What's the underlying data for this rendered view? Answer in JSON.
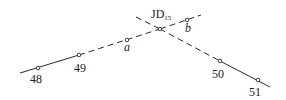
{
  "diagram": {
    "type": "route-intersection",
    "colors": {
      "line": "#2a2a2a",
      "background": "#ffffff"
    },
    "intersection": {
      "label": "JD",
      "subscript": "15",
      "x": 160,
      "y": 29
    },
    "points": [
      {
        "id": "48",
        "label": "48",
        "x": 38,
        "y": 68,
        "lx": 30,
        "ly": 83,
        "style": "num"
      },
      {
        "id": "49",
        "label": "49",
        "x": 79,
        "y": 55,
        "lx": 74,
        "ly": 72,
        "style": "num"
      },
      {
        "id": "a",
        "label": "a",
        "x": 127,
        "y": 40,
        "lx": 124,
        "ly": 51,
        "style": "ital"
      },
      {
        "id": "b",
        "label": "b",
        "x": 187,
        "y": 20,
        "lx": 185,
        "ly": 32,
        "style": "ital"
      },
      {
        "id": "50",
        "label": "50",
        "x": 220,
        "y": 61,
        "lx": 212,
        "ly": 78,
        "style": "num"
      },
      {
        "id": "51",
        "label": "51",
        "x": 258,
        "y": 80,
        "lx": 249,
        "ly": 96,
        "style": "num"
      }
    ],
    "segments": [
      {
        "name": "line-48-49-solid",
        "x1": 20,
        "y1": 73,
        "x2": 79,
        "y2": 55,
        "dashed": false
      },
      {
        "name": "line-49-jd-dashed",
        "x1": 79,
        "y1": 55,
        "x2": 160,
        "y2": 29,
        "dashed": true
      },
      {
        "name": "line-jd-b-dashed",
        "x1": 160,
        "y1": 29,
        "x2": 201,
        "y2": 15,
        "dashed": true
      },
      {
        "name": "line-start-jd-dashed",
        "x1": 136,
        "y1": 17,
        "x2": 160,
        "y2": 29,
        "dashed": true
      },
      {
        "name": "line-jd-50-dashed",
        "x1": 160,
        "y1": 29,
        "x2": 220,
        "y2": 61,
        "dashed": true
      },
      {
        "name": "line-50-51-solid",
        "x1": 220,
        "y1": 61,
        "x2": 270,
        "y2": 87,
        "dashed": false
      }
    ]
  }
}
